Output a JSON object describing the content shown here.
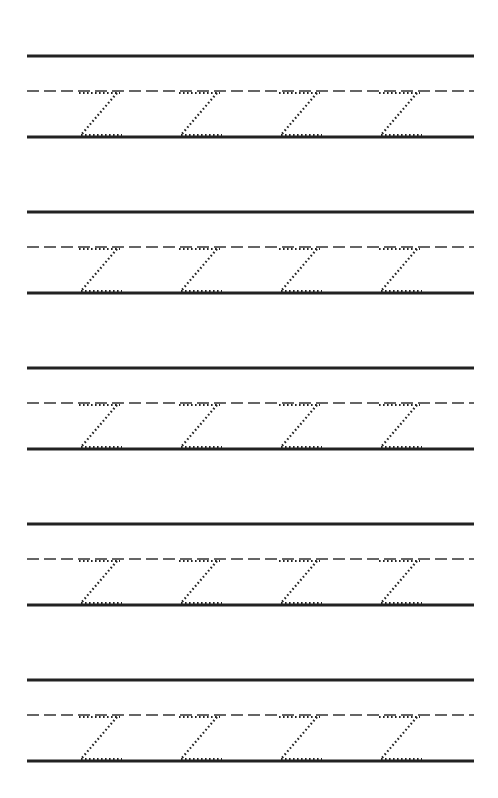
{
  "worksheet": {
    "title": "",
    "letter": "Z",
    "colors": {
      "line": "#222222",
      "guide": "#333333",
      "trace": "#222222",
      "background": "#ffffff"
    },
    "layout": {
      "line_left": 27,
      "line_right": 474,
      "block_offsets": [
        56,
        212,
        368,
        524,
        680
      ],
      "midline_offset": 35,
      "baseline_offset": 81,
      "letter_x": [
        79,
        179,
        279,
        379
      ],
      "letter_width": 41
    },
    "rows": [
      {
        "id": 1,
        "letters": [
          "Z",
          "Z",
          "Z",
          "Z"
        ]
      },
      {
        "id": 2,
        "letters": [
          "Z",
          "Z",
          "Z",
          "Z"
        ]
      },
      {
        "id": 3,
        "letters": [
          "Z",
          "Z",
          "Z",
          "Z"
        ]
      },
      {
        "id": 4,
        "letters": [
          "Z",
          "Z",
          "Z",
          "Z"
        ]
      },
      {
        "id": 5,
        "letters": [
          "Z",
          "Z",
          "Z",
          "Z"
        ]
      }
    ]
  }
}
